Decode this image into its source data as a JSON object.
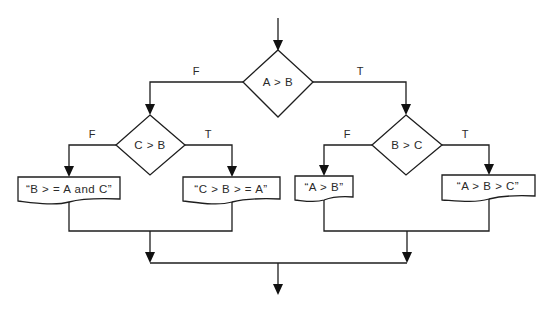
{
  "diagram": {
    "type": "flowchart",
    "decisions": [
      {
        "id": "d1",
        "label": "A > B",
        "false_label": "F",
        "true_label": "T"
      },
      {
        "id": "d2",
        "label": "C > B",
        "false_label": "F",
        "true_label": "T"
      },
      {
        "id": "d3",
        "label": "B > C",
        "false_label": "F",
        "true_label": "T"
      }
    ],
    "outputs": [
      {
        "id": "o1",
        "label": "“B > = A and C”"
      },
      {
        "id": "o2",
        "label": "“C > B > = A”"
      },
      {
        "id": "o3",
        "label": "“A > B”"
      },
      {
        "id": "o4",
        "label": "“A > B > C”"
      }
    ],
    "edges": [
      {
        "from": "start",
        "to": "d1"
      },
      {
        "from": "d1",
        "to": "d2",
        "label": "F"
      },
      {
        "from": "d1",
        "to": "d3",
        "label": "T"
      },
      {
        "from": "d2",
        "to": "o1",
        "label": "F"
      },
      {
        "from": "d2",
        "to": "o2",
        "label": "T"
      },
      {
        "from": "d3",
        "to": "o3",
        "label": "F"
      },
      {
        "from": "d3",
        "to": "o4",
        "label": "T"
      },
      {
        "from": "o1",
        "to": "merge-left"
      },
      {
        "from": "o2",
        "to": "merge-left"
      },
      {
        "from": "o3",
        "to": "merge-right"
      },
      {
        "from": "o4",
        "to": "merge-right"
      },
      {
        "from": "merge-left",
        "to": "end"
      },
      {
        "from": "merge-right",
        "to": "end"
      }
    ],
    "colors": {
      "stroke": "#1e1e1e",
      "background": "#ffffff",
      "text": "#2a2a2a"
    }
  }
}
